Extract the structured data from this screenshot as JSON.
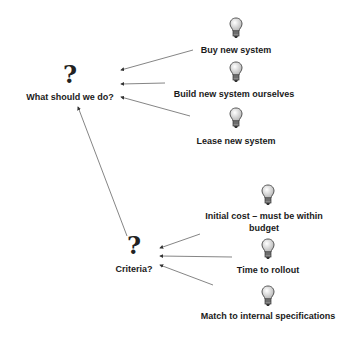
{
  "diagram": {
    "type": "decision-map",
    "background": "#ffffff",
    "questions": [
      {
        "id": "q1",
        "label": "What should we do?",
        "icon": "question-mark-icon"
      },
      {
        "id": "q2",
        "label": "Criteria?",
        "icon": "question-mark-icon"
      }
    ],
    "options": [
      {
        "id": "o1",
        "label": "Buy new system",
        "icon": "lightbulb-icon",
        "target": "q1"
      },
      {
        "id": "o2",
        "label": "Build new system ourselves",
        "icon": "lightbulb-icon",
        "target": "q1"
      },
      {
        "id": "o3",
        "label": "Lease new system",
        "icon": "lightbulb-icon",
        "target": "q1"
      }
    ],
    "criteria": [
      {
        "id": "c1",
        "label_line1": "Initial cost – must be within",
        "label_line2": "budget",
        "icon": "lightbulb-icon",
        "target": "q2"
      },
      {
        "id": "c2",
        "label": "Time to rollout",
        "icon": "lightbulb-icon",
        "target": "q2"
      },
      {
        "id": "c3",
        "label": "Match to internal specifications",
        "icon": "lightbulb-icon",
        "target": "q2"
      }
    ],
    "links": [
      {
        "from": "o1",
        "to": "q1"
      },
      {
        "from": "o2",
        "to": "q1"
      },
      {
        "from": "o3",
        "to": "q1"
      },
      {
        "from": "q2",
        "to": "q1"
      },
      {
        "from": "c1",
        "to": "q2"
      },
      {
        "from": "c2",
        "to": "q2"
      },
      {
        "from": "c3",
        "to": "q2"
      }
    ],
    "colors": {
      "text": "#1a1a1a",
      "line": "#555555",
      "bulb": "#dcdcdc"
    },
    "question_glyph": "?"
  }
}
